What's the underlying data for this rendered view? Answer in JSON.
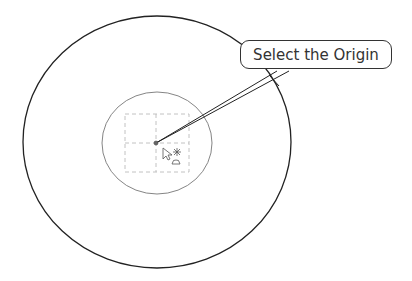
{
  "callout": {
    "text": "Select the Origin"
  },
  "diagram": {
    "outer_circle": {
      "cx": 157,
      "cy": 142,
      "rx": 134,
      "ry": 126,
      "color": "#222222"
    },
    "inner_circle": {
      "cx": 157,
      "cy": 143,
      "rx": 55,
      "ry": 51,
      "color": "#666666"
    },
    "dashed_grid": {
      "x": 125,
      "y": 114,
      "w": 64,
      "h": 58,
      "color": "#bbbbbb"
    },
    "origin_point": {
      "x": 156,
      "y": 143
    },
    "cursor": {
      "icon": "pointer-with-origin-symbol"
    }
  }
}
